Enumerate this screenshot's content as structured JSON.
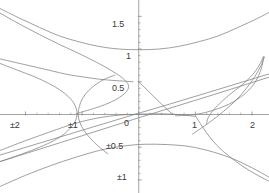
{
  "figure": {
    "name": "conic-family-plot",
    "background_color": "#ffffff",
    "axis_color": "#8c8c8c",
    "curve_color": "#808080",
    "label_color": "#3a3a3a",
    "width_px": 269,
    "height_px": 193
  },
  "chart_data": {
    "type": "line",
    "title": "",
    "subtitle": "",
    "xlabel": "",
    "ylabel": "",
    "xlim": [
      -2.45,
      2.3
    ],
    "ylim": [
      -1.2,
      1.75
    ],
    "grid": false,
    "legend": null,
    "legend_position": "none",
    "axes": {
      "x_axis_y_value": 0,
      "y_axis_x_value": 0,
      "x_ticks": [
        {
          "value": -2,
          "label": "±2"
        },
        {
          "value": -1,
          "label": "±1"
        },
        {
          "value": 0,
          "label": "0"
        },
        {
          "value": 1,
          "label": "1"
        },
        {
          "value": 2,
          "label": "2"
        }
      ],
      "y_ticks": [
        {
          "value": 1.5,
          "label": "1.5"
        },
        {
          "value": 1.0,
          "label": "1"
        },
        {
          "value": 0.5,
          "label": "0.5"
        },
        {
          "value": -0.5,
          "label": "±0.5"
        },
        {
          "value": -1.0,
          "label": "±1"
        }
      ],
      "minor_tick_count_x": 4,
      "minor_tick_count_y": 4
    },
    "series": [
      {
        "name": "upper-right-branch-outer",
        "kind": "hyperbola-branch",
        "points": [
          [
            -2.45,
            1.62
          ],
          [
            -2.1,
            1.47
          ],
          [
            -1.75,
            1.33
          ],
          [
            -1.4,
            1.2
          ],
          [
            -1.05,
            1.11
          ],
          [
            -0.7,
            1.04
          ],
          [
            -0.35,
            1.0
          ],
          [
            0.0,
            0.99
          ],
          [
            0.35,
            1.0
          ],
          [
            0.7,
            1.04
          ],
          [
            1.05,
            1.11
          ],
          [
            1.4,
            1.2
          ],
          [
            1.75,
            1.33
          ],
          [
            2.1,
            1.47
          ],
          [
            2.3,
            1.56
          ]
        ]
      },
      {
        "name": "left-opening-branch-upper-outer",
        "kind": "hyperbola-branch",
        "points": [
          [
            -2.45,
            1.55
          ],
          [
            -2.1,
            1.38
          ],
          [
            -1.75,
            1.22
          ],
          [
            -1.4,
            1.07
          ],
          [
            -1.05,
            0.93
          ],
          [
            -0.75,
            0.8
          ],
          [
            -0.5,
            0.68
          ],
          [
            -0.32,
            0.58
          ],
          [
            -0.22,
            0.5
          ],
          [
            -0.18,
            0.44
          ],
          [
            -0.2,
            0.37
          ],
          [
            -0.28,
            0.3
          ],
          [
            -0.42,
            0.22
          ],
          [
            -0.6,
            0.15
          ],
          [
            -0.8,
            0.09
          ],
          [
            -1.0,
            0.04
          ],
          [
            -1.1,
            0.01
          ]
        ]
      },
      {
        "name": "left-opening-branch-inner",
        "kind": "hyperbola-branch",
        "points": [
          [
            -2.45,
            0.85
          ],
          [
            -2.15,
            0.79
          ],
          [
            -1.85,
            0.73
          ],
          [
            -1.55,
            0.67
          ],
          [
            -1.25,
            0.61
          ],
          [
            -0.95,
            0.57
          ],
          [
            -0.7,
            0.54
          ],
          [
            -0.45,
            0.52
          ],
          [
            -0.25,
            0.51
          ],
          [
            -0.1,
            0.5
          ]
        ]
      },
      {
        "name": "left-opening-branch-lower-outer",
        "kind": "hyperbola-branch",
        "points": [
          [
            -2.45,
            0.78
          ],
          [
            -2.15,
            0.68
          ],
          [
            -1.85,
            0.58
          ],
          [
            -1.6,
            0.48
          ],
          [
            -1.4,
            0.38
          ],
          [
            -1.25,
            0.28
          ],
          [
            -1.15,
            0.18
          ],
          [
            -1.1,
            0.08
          ],
          [
            -1.09,
            0.0
          ],
          [
            -1.12,
            -0.1
          ],
          [
            -1.2,
            -0.2
          ],
          [
            -1.32,
            -0.3
          ],
          [
            -1.5,
            -0.4
          ],
          [
            -1.75,
            -0.5
          ],
          [
            -2.05,
            -0.6
          ],
          [
            -2.45,
            -0.72
          ]
        ]
      },
      {
        "name": "ascending-line-steeper",
        "kind": "line",
        "points": [
          [
            -2.45,
            -0.62
          ],
          [
            0.0,
            0.02
          ],
          [
            0.55,
            0.16
          ],
          [
            1.2,
            0.33
          ],
          [
            2.3,
            0.62
          ]
        ]
      },
      {
        "name": "ascending-line-shallower",
        "kind": "line",
        "points": [
          [
            -2.45,
            -0.72
          ],
          [
            -1.2,
            -0.38
          ],
          [
            0.0,
            -0.05
          ],
          [
            1.2,
            0.27
          ],
          [
            2.3,
            0.57
          ]
        ]
      },
      {
        "name": "descending-segment-from-half",
        "kind": "line-segment",
        "points": [
          [
            0.0,
            0.5
          ],
          [
            0.2,
            0.33
          ],
          [
            0.4,
            0.16
          ],
          [
            0.6,
            0.0
          ]
        ]
      },
      {
        "name": "flat-arc-through-origin",
        "kind": "curve",
        "points": [
          [
            -2.45,
            -0.55
          ],
          [
            -2.0,
            -0.4
          ],
          [
            -1.55,
            -0.26
          ],
          [
            -1.1,
            -0.13
          ],
          [
            -0.7,
            -0.05
          ],
          [
            -0.35,
            -0.01
          ],
          [
            0.0,
            0.005
          ],
          [
            0.35,
            0.01
          ],
          [
            0.7,
            0.0
          ],
          [
            1.0,
            -0.03
          ]
        ]
      },
      {
        "name": "right-descending-branch-through-one",
        "kind": "hyperbola-branch",
        "points": [
          [
            1.0,
            -0.02
          ],
          [
            1.12,
            -0.18
          ],
          [
            1.24,
            -0.33
          ],
          [
            1.4,
            -0.49
          ],
          [
            1.6,
            -0.64
          ],
          [
            1.85,
            -0.8
          ],
          [
            2.1,
            -0.93
          ],
          [
            2.3,
            -1.02
          ]
        ]
      },
      {
        "name": "downward-arc-lower",
        "kind": "curve",
        "points": [
          [
            -2.45,
            -1.1
          ],
          [
            -2.0,
            -0.93
          ],
          [
            -1.55,
            -0.78
          ],
          [
            -1.1,
            -0.65
          ],
          [
            -0.65,
            -0.54
          ],
          [
            -0.25,
            -0.48
          ],
          [
            0.1,
            -0.455
          ],
          [
            0.5,
            -0.46
          ],
          [
            0.9,
            -0.49
          ],
          [
            1.3,
            -0.57
          ],
          [
            1.7,
            -0.69
          ],
          [
            2.1,
            -0.86
          ],
          [
            2.3,
            -0.96
          ]
        ]
      },
      {
        "name": "right-opening-branch-upper",
        "kind": "hyperbola-branch",
        "points": [
          [
            0.65,
            -0.02
          ],
          [
            1.0,
            0.0
          ],
          [
            1.3,
            0.06
          ],
          [
            1.6,
            0.16
          ],
          [
            1.85,
            0.3
          ],
          [
            2.02,
            0.45
          ],
          [
            2.12,
            0.6
          ],
          [
            2.18,
            0.75
          ],
          [
            2.2,
            0.88
          ]
        ]
      },
      {
        "name": "right-opening-branch-lower",
        "kind": "hyperbola-branch",
        "points": [
          [
            2.2,
            0.88
          ],
          [
            2.12,
            0.74
          ],
          [
            2.0,
            0.6
          ],
          [
            1.82,
            0.45
          ],
          [
            1.6,
            0.3
          ],
          [
            1.42,
            0.16
          ],
          [
            1.3,
            0.05
          ],
          [
            1.22,
            -0.06
          ],
          [
            1.2,
            -0.14
          ]
        ]
      },
      {
        "name": "right-inner-ascending-curve",
        "kind": "curve",
        "points": [
          [
            0.95,
            -0.3
          ],
          [
            1.25,
            -0.12
          ],
          [
            1.5,
            0.05
          ],
          [
            1.72,
            0.22
          ],
          [
            1.9,
            0.4
          ],
          [
            2.05,
            0.58
          ],
          [
            2.16,
            0.75
          ],
          [
            2.22,
            0.88
          ]
        ]
      },
      {
        "name": "left-vertex-arc-near-one",
        "kind": "hyperbola-branch",
        "points": [
          [
            -0.55,
            -0.6
          ],
          [
            -0.72,
            -0.48
          ],
          [
            -0.86,
            -0.36
          ],
          [
            -0.97,
            -0.24
          ],
          [
            -1.04,
            -0.12
          ],
          [
            -1.07,
            0.0
          ],
          [
            -1.05,
            0.12
          ],
          [
            -0.99,
            0.25
          ],
          [
            -0.88,
            0.37
          ],
          [
            -0.74,
            0.47
          ],
          [
            -0.58,
            0.55
          ],
          [
            -0.42,
            0.6
          ]
        ]
      }
    ]
  },
  "labels": {
    "x": [
      {
        "name": "x-tick-label-minus-2",
        "text": "±2",
        "left_px": 10,
        "top_px": 121
      },
      {
        "name": "x-tick-label-minus-1",
        "text": "±1",
        "left_px": 68,
        "top_px": 121
      },
      {
        "name": "x-tick-label-0",
        "text": "0",
        "left_px": 124,
        "top_px": 119
      },
      {
        "name": "x-tick-label-1",
        "text": "1",
        "left_px": 192,
        "top_px": 121
      },
      {
        "name": "x-tick-label-2",
        "text": "2",
        "left_px": 250,
        "top_px": 121
      }
    ],
    "y": [
      {
        "name": "y-tick-label-1-5",
        "text": "1.5",
        "left_px": 112,
        "top_px": 20
      },
      {
        "name": "y-tick-label-1",
        "text": "1",
        "left_px": 126,
        "top_px": 52
      },
      {
        "name": "y-tick-label-0-5",
        "text": "0.5",
        "left_px": 112,
        "top_px": 84
      },
      {
        "name": "y-tick-label-minus-0-5",
        "text": "±0.5",
        "left_px": 106,
        "top_px": 142
      },
      {
        "name": "y-tick-label-minus-1",
        "text": "±1",
        "left_px": 117,
        "top_px": 173
      }
    ]
  }
}
